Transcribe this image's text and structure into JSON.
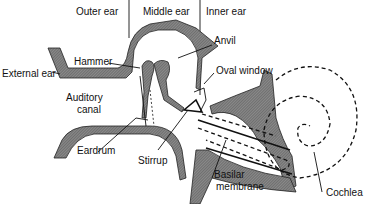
{
  "diagram": {
    "regions": [
      {
        "id": "outer",
        "label": "Outer ear"
      },
      {
        "id": "middle",
        "label": "Middle ear"
      },
      {
        "id": "inner",
        "label": "Inner ear"
      }
    ],
    "labels": {
      "external_ear": "External ear",
      "hammer": "Hammer",
      "anvil": "Anvil",
      "oval_window": "Oval window",
      "auditory_canal_1": "Auditory",
      "auditory_canal_2": "canal",
      "eardrum": "Eardrum",
      "stirrup": "Stirrup",
      "basilar_1": "Basilar",
      "basilar_2": "membrane",
      "cochlea": "Cochlea"
    },
    "colors": {
      "ink": "#111111",
      "bone_fill": "#7a7a7a",
      "background": "#ffffff"
    }
  }
}
